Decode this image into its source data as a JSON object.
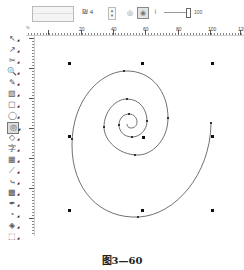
{
  "property_bar": {
    "object_origin_icon": "object-origin-grid-icon",
    "spiral_turns_icon": "spiral-turns-icon",
    "spiral_turns_value": "4",
    "symmetrical_spiral_icon": "symmetrical-spiral-icon",
    "logarithmic_spiral_icon": "logarithmic-spiral-icon",
    "logarithmic_spiral_active": true,
    "expansion_factor_icon": "expansion-factor-icon",
    "expansion_factor_value": "100"
  },
  "ruler": {
    "units_corner": "%",
    "horizontal_labels": [
      {
        "text": "0",
        "pos": 116
      },
      {
        "text": "20",
        "pos": 149
      },
      {
        "text": "40",
        "pos": 181
      },
      {
        "text": "60",
        "pos": 214
      }
    ]
  },
  "toolbox": {
    "tools": [
      {
        "name": "pick-tool-icon",
        "glyph": "↖"
      },
      {
        "name": "shape-tool-icon",
        "glyph": "↗"
      },
      {
        "name": "crop-tool-icon",
        "glyph": "✂"
      },
      {
        "name": "zoom-tool-icon",
        "glyph": "🔍"
      },
      {
        "name": "freehand-tool-icon",
        "glyph": "✎"
      },
      {
        "name": "smart-fill-tool-icon",
        "glyph": "▨"
      },
      {
        "name": "rectangle-tool-icon",
        "glyph": "▢"
      },
      {
        "name": "ellipse-tool-icon",
        "glyph": "◯"
      },
      {
        "name": "polygon-spiral-tool-icon",
        "glyph": "◎",
        "active": true
      },
      {
        "name": "basic-shapes-tool-icon",
        "glyph": "◇"
      },
      {
        "name": "text-tool-icon",
        "glyph": "字"
      },
      {
        "name": "table-tool-icon",
        "glyph": "▦"
      },
      {
        "name": "dimension-tool-icon",
        "glyph": "⟋"
      },
      {
        "name": "connector-tool-icon",
        "glyph": "⤷"
      },
      {
        "name": "interactive-fill-tool-icon",
        "glyph": "▩"
      },
      {
        "name": "eyedropper-tool-icon",
        "glyph": "✒"
      },
      {
        "name": "outline-tool-icon",
        "glyph": "◔"
      },
      {
        "name": "fill-tool-icon",
        "glyph": "◈"
      },
      {
        "name": "interactive-blend-tool-icon",
        "glyph": "⬚"
      }
    ]
  },
  "canvas": {
    "object": "logarithmic spiral",
    "selection_handles": 8
  },
  "caption": "图3—60"
}
